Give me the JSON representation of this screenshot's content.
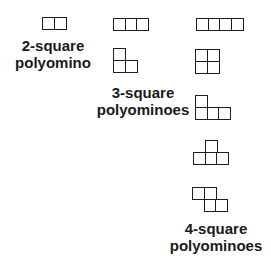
{
  "diagram": {
    "groups": [
      {
        "id": "2-square",
        "label_line1": "2-square",
        "label_line2": "polyomino",
        "shapes": [
          {
            "name": "domino",
            "origin": [
              42,
              17
            ],
            "cells": [
              [
                0,
                0
              ],
              [
                1,
                0
              ]
            ]
          }
        ]
      },
      {
        "id": "3-square",
        "label_line1": "3-square",
        "label_line2": "polyominoes",
        "shapes": [
          {
            "name": "straight-tromino",
            "origin": [
              113,
              18
            ],
            "cells": [
              [
                0,
                0
              ],
              [
                1,
                0
              ],
              [
                2,
                0
              ]
            ]
          },
          {
            "name": "l-tromino",
            "origin": [
              113,
              48
            ],
            "cells": [
              [
                0,
                0
              ],
              [
                0,
                1
              ],
              [
                1,
                1
              ]
            ]
          }
        ]
      },
      {
        "id": "4-square",
        "label_line1": "4-square",
        "label_line2": "polyominoes",
        "shapes": [
          {
            "name": "i-tetromino",
            "origin": [
              196,
              18
            ],
            "cells": [
              [
                0,
                0
              ],
              [
                1,
                0
              ],
              [
                2,
                0
              ],
              [
                3,
                0
              ]
            ]
          },
          {
            "name": "o-tetromino",
            "origin": [
              195,
              49
            ],
            "cells": [
              [
                0,
                0
              ],
              [
                1,
                0
              ],
              [
                0,
                1
              ],
              [
                1,
                1
              ]
            ]
          },
          {
            "name": "l-tetromino",
            "origin": [
              195,
              95
            ],
            "cells": [
              [
                0,
                0
              ],
              [
                0,
                1
              ],
              [
                1,
                1
              ],
              [
                2,
                1
              ]
            ]
          },
          {
            "name": "t-tetromino",
            "origin": [
              193,
              140
            ],
            "cells": [
              [
                1,
                0
              ],
              [
                0,
                1
              ],
              [
                1,
                1
              ],
              [
                2,
                1
              ]
            ]
          },
          {
            "name": "s-tetromino",
            "origin": [
              192,
              187
            ],
            "cells": [
              [
                0,
                0
              ],
              [
                1,
                0
              ],
              [
                1,
                1
              ],
              [
                2,
                1
              ]
            ]
          }
        ]
      }
    ]
  }
}
